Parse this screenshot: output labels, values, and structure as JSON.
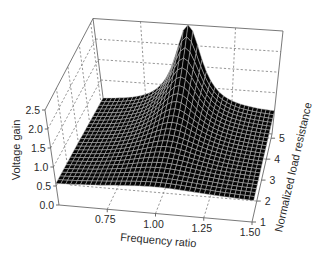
{
  "chart_data": {
    "type": "surface3d",
    "title": "",
    "xlabel": "Frequency ratio",
    "ylabel": "Normalized load resistance",
    "zlabel": "Voltage gain",
    "xlim": [
      0.5,
      1.5
    ],
    "ylim": [
      1,
      5.2
    ],
    "zlim": [
      0,
      2.5
    ],
    "x_ticks": [
      "0.75",
      "1.00",
      "1.25",
      "1.50"
    ],
    "x_tick_values": [
      0.75,
      1.0,
      1.25,
      1.5
    ],
    "y_ticks": [
      "1",
      "2",
      "3",
      "4",
      "5"
    ],
    "y_tick_values": [
      1,
      2,
      3,
      4,
      5
    ],
    "z_ticks": [
      "0.0",
      "0.5",
      "1.0",
      "1.5",
      "2.0",
      "2.5"
    ],
    "z_tick_values": [
      0,
      0.5,
      1.0,
      1.5,
      2.0,
      2.5
    ],
    "grid": true,
    "legend": null,
    "surface_colors": {
      "fill": "#050505",
      "mesh": "#c8c8c8"
    },
    "surface_model": {
      "description": "gain = base + h(r) / (1 + ((f - f0)/w(r))^2), s = (r - 1)/(rmax - 1)",
      "base": 0.5,
      "f0": 1.0,
      "h_front": 0.2,
      "h_back": 2.0,
      "w_front": 0.35,
      "w_back": 0.09,
      "mesh_freq_lines": 41,
      "mesh_load_lines": 24
    },
    "x": [
      0.5,
      0.625,
      0.75,
      0.875,
      1.0,
      1.125,
      1.25,
      1.375,
      1.5
    ],
    "series": [
      {
        "name": "load=1.0",
        "values": [
          0.57,
          0.59,
          0.63,
          0.68,
          0.7,
          0.68,
          0.63,
          0.59,
          0.57
        ]
      },
      {
        "name": "load=1.5",
        "values": [
          0.57,
          0.6,
          0.65,
          0.72,
          0.76,
          0.72,
          0.65,
          0.6,
          0.57
        ]
      },
      {
        "name": "load=2.0",
        "values": [
          0.57,
          0.61,
          0.67,
          0.77,
          0.83,
          0.77,
          0.67,
          0.61,
          0.57
        ]
      },
      {
        "name": "load=2.5",
        "values": [
          0.57,
          0.61,
          0.69,
          0.83,
          0.93,
          0.83,
          0.69,
          0.61,
          0.57
        ]
      },
      {
        "name": "load=3.0",
        "values": [
          0.57,
          0.62,
          0.71,
          0.89,
          1.06,
          0.89,
          0.71,
          0.62,
          0.57
        ]
      },
      {
        "name": "load=3.5",
        "values": [
          0.57,
          0.62,
          0.72,
          0.96,
          1.22,
          0.96,
          0.72,
          0.62,
          0.57
        ]
      },
      {
        "name": "load=4.0",
        "values": [
          0.57,
          0.62,
          0.72,
          1.02,
          1.43,
          1.02,
          0.72,
          0.62,
          0.57
        ]
      },
      {
        "name": "load=4.5",
        "values": [
          0.57,
          0.62,
          0.73,
          1.09,
          1.7,
          1.09,
          0.73,
          0.62,
          0.57
        ]
      },
      {
        "name": "load=5.0",
        "values": [
          0.57,
          0.61,
          0.73,
          1.14,
          2.05,
          1.14,
          0.73,
          0.61,
          0.57
        ]
      },
      {
        "name": "load=5.2",
        "values": [
          0.56,
          0.61,
          0.73,
          1.18,
          2.5,
          1.18,
          0.73,
          0.61,
          0.56
        ]
      }
    ],
    "projection": {
      "floor": {
        "FL": [
          59,
          205
        ],
        "FR": [
          252,
          222
        ],
        "BL": [
          106,
          121
        ],
        "BR": [
          272,
          134
        ]
      },
      "up_per_unit": {
        "FL": [
          -5.6,
          -38
        ],
        "FR": [
          3,
          -38
        ],
        "BL": [
          -5.2,
          -41
        ],
        "BR": [
          4.4,
          -41.2
        ]
      }
    },
    "label_positions": {
      "xlabel": [
        158,
        244,
        5
      ],
      "zlabel": [
        20,
        150,
        -90
      ],
      "ylabel": [
        297,
        168,
        -77
      ]
    }
  }
}
